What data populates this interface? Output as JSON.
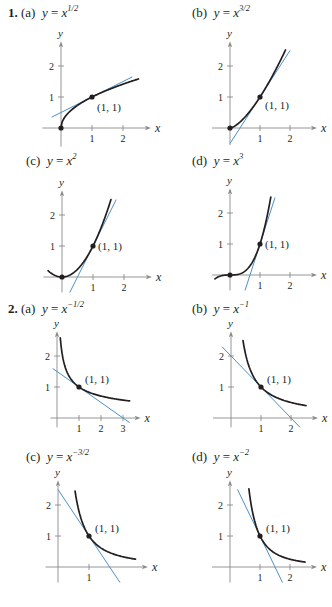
{
  "problems": [
    {
      "number": "1.",
      "parts": [
        {
          "label": "(a)",
          "lhs": "y",
          "base": "x",
          "exp": "1/2"
        },
        {
          "label": "(b)",
          "lhs": "y",
          "base": "x",
          "exp": "3/2"
        },
        {
          "label": "(c)",
          "lhs": "y",
          "base": "x",
          "exp": "2"
        },
        {
          "label": "(d)",
          "lhs": "y",
          "base": "x",
          "exp": "3"
        }
      ]
    },
    {
      "number": "2.",
      "parts": [
        {
          "label": "(a)",
          "lhs": "y",
          "base": "x",
          "exp": "−1/2"
        },
        {
          "label": "(b)",
          "lhs": "y",
          "base": "x",
          "exp": "−1"
        },
        {
          "label": "(c)",
          "lhs": "y",
          "base": "x",
          "exp": "−3/2"
        },
        {
          "label": "(d)",
          "lhs": "y",
          "base": "x",
          "exp": "−2"
        }
      ]
    }
  ],
  "point_label": "(1, 1)",
  "axis_labels": {
    "x": "x",
    "y": "y"
  },
  "colors": {
    "curve": "#231f20",
    "tangent": "#4a90c8",
    "axis": "#8a8a8a"
  },
  "chart_data": [
    {
      "type": "line",
      "title": "y = x^(1/2)",
      "xlabel": "x",
      "ylabel": "y",
      "xticks": [
        1,
        2
      ],
      "yticks": [
        1,
        2
      ],
      "xlim": [
        -0.3,
        2.7
      ],
      "ylim": [
        -0.5,
        2.6
      ],
      "series": [
        {
          "name": "y = x^(1/2)",
          "x": [
            0,
            0.25,
            0.5,
            1,
            1.5,
            2,
            2.5
          ],
          "y": [
            0,
            0.5,
            0.707,
            1,
            1.225,
            1.414,
            1.581
          ]
        },
        {
          "name": "tangent y = 0.5x + 0.5",
          "x": [
            -0.3,
            2.3
          ],
          "y": [
            0.35,
            1.65
          ]
        }
      ],
      "points": [
        {
          "x": 0,
          "y": 0
        },
        {
          "x": 1,
          "y": 1,
          "label": "(1, 1)"
        }
      ]
    },
    {
      "type": "line",
      "title": "y = x^(3/2)",
      "xlabel": "x",
      "ylabel": "y",
      "xticks": [
        1,
        2
      ],
      "yticks": [
        1,
        2
      ],
      "xlim": [
        -0.3,
        2.7
      ],
      "ylim": [
        -0.5,
        2.6
      ],
      "series": [
        {
          "name": "y = x^(3/2)",
          "x": [
            0,
            0.5,
            1,
            1.5,
            1.85
          ],
          "y": [
            0,
            0.354,
            1,
            1.837,
            2.516
          ]
        },
        {
          "name": "tangent y = 1.5x - 0.5",
          "x": [
            0,
            2
          ],
          "y": [
            -0.5,
            2.5
          ]
        }
      ],
      "points": [
        {
          "x": 0,
          "y": 0
        },
        {
          "x": 1,
          "y": 1,
          "label": "(1, 1)"
        }
      ]
    },
    {
      "type": "line",
      "title": "y = x^2",
      "xlabel": "x",
      "ylabel": "y",
      "xticks": [
        1,
        2
      ],
      "yticks": [
        1,
        2
      ],
      "xlim": [
        -0.5,
        2.7
      ],
      "ylim": [
        -0.5,
        2.6
      ],
      "series": [
        {
          "name": "y = x^2",
          "x": [
            -0.45,
            0,
            0.5,
            1,
            1.3,
            1.58
          ],
          "y": [
            0.2,
            0,
            0.25,
            1,
            1.69,
            2.5
          ]
        },
        {
          "name": "tangent y = 2x - 1",
          "x": [
            0.25,
            1.75
          ],
          "y": [
            -0.5,
            2.5
          ]
        }
      ],
      "points": [
        {
          "x": 0,
          "y": 0
        },
        {
          "x": 1,
          "y": 1,
          "label": "(1, 1)"
        }
      ]
    },
    {
      "type": "line",
      "title": "y = x^3",
      "xlabel": "x",
      "ylabel": "y",
      "xticks": [
        1,
        2
      ],
      "yticks": [
        1,
        2
      ],
      "xlim": [
        -0.5,
        2.7
      ],
      "ylim": [
        -0.5,
        2.6
      ],
      "series": [
        {
          "name": "y = x^3",
          "x": [
            -0.5,
            0,
            0.5,
            1,
            1.2,
            1.36
          ],
          "y": [
            -0.125,
            0,
            0.125,
            1,
            1.728,
            2.515
          ]
        },
        {
          "name": "tangent y = 3x - 2",
          "x": [
            0.5,
            1.5
          ],
          "y": [
            -0.5,
            2.5
          ]
        }
      ],
      "points": [
        {
          "x": 0,
          "y": 0
        },
        {
          "x": 1,
          "y": 1,
          "label": "(1, 1)"
        }
      ]
    },
    {
      "type": "line",
      "title": "y = x^(-1/2)",
      "xlabel": "x",
      "ylabel": "y",
      "xticks": [
        1,
        2,
        3
      ],
      "yticks": [
        1,
        2
      ],
      "xlim": [
        -0.2,
        3.5
      ],
      "ylim": [
        -0.3,
        2.6
      ],
      "series": [
        {
          "name": "y = x^(-1/2)",
          "x": [
            0.15,
            0.25,
            0.5,
            1,
            2,
            3.3
          ],
          "y": [
            2.58,
            2,
            1.414,
            1,
            0.707,
            0.55
          ]
        },
        {
          "name": "tangent y = -0.5x + 1.5",
          "x": [
            -0.2,
            3.3
          ],
          "y": [
            1.6,
            -0.15
          ]
        }
      ],
      "points": [
        {
          "x": 1,
          "y": 1,
          "label": "(1, 1)"
        }
      ]
    },
    {
      "type": "line",
      "title": "y = x^(-1)",
      "xlabel": "x",
      "ylabel": "y",
      "xticks": [
        1,
        2
      ],
      "yticks": [
        1,
        2
      ],
      "xlim": [
        -0.3,
        2.7
      ],
      "ylim": [
        -0.3,
        2.6
      ],
      "series": [
        {
          "name": "y = x^(-1)",
          "x": [
            0.4,
            0.5,
            1,
            1.5,
            2,
            2.5
          ],
          "y": [
            2.5,
            2,
            1,
            0.667,
            0.5,
            0.4
          ]
        },
        {
          "name": "tangent y = -x + 2",
          "x": [
            -0.3,
            2.3
          ],
          "y": [
            2.3,
            -0.3
          ]
        }
      ],
      "points": [
        {
          "x": 1,
          "y": 1,
          "label": "(1, 1)"
        }
      ]
    },
    {
      "type": "line",
      "title": "y = x^(-3/2)",
      "xlabel": "x",
      "ylabel": "y",
      "xticks": [
        1
      ],
      "yticks": [
        1,
        2
      ],
      "xlim": [
        -0.2,
        2.7
      ],
      "ylim": [
        -0.5,
        2.6
      ],
      "series": [
        {
          "name": "y = x^(-3/2)",
          "x": [
            0.55,
            0.75,
            1,
            1.5,
            2,
            2.5
          ],
          "y": [
            2.45,
            1.54,
            1,
            0.544,
            0.354,
            0.253
          ]
        },
        {
          "name": "tangent y = -1.5x + 2.5",
          "x": [
            0,
            2
          ],
          "y": [
            2.5,
            -0.5
          ]
        }
      ],
      "points": [
        {
          "x": 1,
          "y": 1,
          "label": "(1, 1)"
        }
      ]
    },
    {
      "type": "line",
      "title": "y = x^(-2)",
      "xlabel": "x",
      "ylabel": "y",
      "xticks": [
        1,
        2
      ],
      "yticks": [
        1,
        2
      ],
      "xlim": [
        -0.3,
        2.7
      ],
      "ylim": [
        -0.5,
        2.6
      ],
      "series": [
        {
          "name": "y = x^(-2)",
          "x": [
            0.63,
            0.75,
            1,
            1.5,
            2,
            2.5
          ],
          "y": [
            2.52,
            1.78,
            1,
            0.444,
            0.25,
            0.16
          ]
        },
        {
          "name": "tangent y = -2x + 3",
          "x": [
            0.25,
            1.75
          ],
          "y": [
            2.5,
            -0.5
          ]
        }
      ],
      "points": [
        {
          "x": 1,
          "y": 1,
          "label": "(1, 1)"
        }
      ]
    }
  ]
}
